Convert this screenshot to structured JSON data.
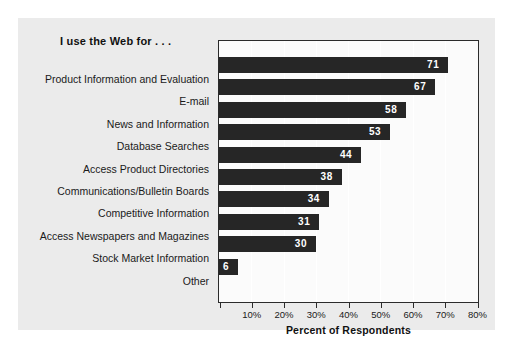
{
  "chart_data": {
    "type": "bar",
    "orientation": "horizontal",
    "title": "I use the Web for . . .",
    "xlabel": "Percent of Respondents",
    "ylabel": "",
    "xlim": [
      0,
      80
    ],
    "xticks": [
      0,
      10,
      20,
      30,
      40,
      50,
      60,
      70,
      80
    ],
    "xtick_labels": [
      "10%",
      "20%",
      "30%",
      "40%",
      "50%",
      "60%",
      "70%",
      "80%"
    ],
    "grid": true,
    "legend": "none",
    "bar_color": "#262626",
    "value_label_color": "#ffffff",
    "panel_color": "#ebebeb",
    "plot_background": "#fbfbfb",
    "categories": [
      "Product Information and Evaluation",
      "E-mail",
      "News and Information",
      "Database Searches",
      "Access Product Directories",
      "Communications/Bulletin Boards",
      "Competitive Information",
      "Access Newspapers and Magazines",
      "Stock Market Information",
      "Other"
    ],
    "values": [
      71,
      67,
      58,
      53,
      44,
      38,
      34,
      31,
      30,
      6
    ],
    "value_labels": [
      "71",
      "67",
      "58",
      "53",
      "44",
      "38",
      "34",
      "31",
      "30",
      "6"
    ]
  }
}
